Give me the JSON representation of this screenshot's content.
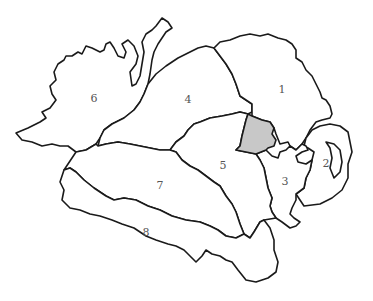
{
  "map": {
    "type": "outline map",
    "colors": {
      "background": "#ffffff",
      "border": "#1a1a1a",
      "lake": "#c8c8c8",
      "label": "#555555"
    },
    "regions": [
      {
        "label": "1",
        "x": 282,
        "y": 89
      },
      {
        "label": "2",
        "x": 326,
        "y": 163
      },
      {
        "label": "3",
        "x": 285,
        "y": 181
      },
      {
        "label": "4",
        "x": 188,
        "y": 99
      },
      {
        "label": "5",
        "x": 223,
        "y": 165
      },
      {
        "label": "6",
        "x": 94,
        "y": 98
      },
      {
        "label": "7",
        "x": 160,
        "y": 185
      },
      {
        "label": "8",
        "x": 146,
        "y": 232
      }
    ],
    "lake": {
      "name": "shaded lake",
      "fill": "#c8c8c8"
    }
  }
}
